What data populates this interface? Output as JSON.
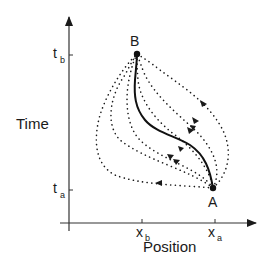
{
  "diagram": {
    "y_axis_label": "Time",
    "x_axis_label": "Position",
    "y_ticks": [
      {
        "main": "t",
        "sub": "b"
      },
      {
        "main": "t",
        "sub": "a"
      }
    ],
    "x_ticks": [
      {
        "main": "x",
        "sub": "b"
      },
      {
        "main": "x",
        "sub": "a"
      }
    ],
    "points": [
      {
        "label": "B",
        "description": "end point (x_b, t_b)"
      },
      {
        "label": "A",
        "description": "start point (x_a, t_a)"
      }
    ],
    "paths": {
      "solid_count": 1,
      "dotted_count": 6,
      "description": "Solid classical path from A to B with dotted alternative paths with direction arrows"
    },
    "colors": {
      "ink": "#1a1a1a",
      "background": "#ffffff"
    }
  }
}
